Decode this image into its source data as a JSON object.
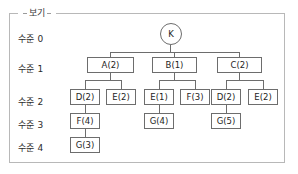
{
  "group": {
    "legend": "보기"
  },
  "levels": [
    {
      "label": "수준 0",
      "x": 18,
      "y": 32
    },
    {
      "label": "수준 1",
      "x": 18,
      "y": 62
    },
    {
      "label": "수준 2",
      "x": 18,
      "y": 95
    },
    {
      "label": "수준 3",
      "x": 18,
      "y": 118
    },
    {
      "label": "수준 4",
      "x": 18,
      "y": 141
    }
  ],
  "nodes": [
    {
      "id": "root",
      "label": "K",
      "shape": "circle",
      "x": 160,
      "y": 23,
      "w": 22,
      "h": 22
    },
    {
      "id": "a",
      "label": "A(2)",
      "shape": "rect",
      "x": 87,
      "y": 57,
      "w": 47,
      "h": 16
    },
    {
      "id": "b",
      "label": "B(1)",
      "shape": "rect",
      "x": 152,
      "y": 57,
      "w": 45,
      "h": 16
    },
    {
      "id": "c",
      "label": "C(2)",
      "shape": "rect",
      "x": 217,
      "y": 57,
      "w": 45,
      "h": 16
    },
    {
      "id": "a-d",
      "label": "D(2)",
      "shape": "rect",
      "x": 70,
      "y": 89,
      "w": 30,
      "h": 16
    },
    {
      "id": "a-e",
      "label": "E(2)",
      "shape": "rect",
      "x": 106,
      "y": 89,
      "w": 30,
      "h": 16
    },
    {
      "id": "b-e",
      "label": "E(1)",
      "shape": "rect",
      "x": 144,
      "y": 89,
      "w": 30,
      "h": 16
    },
    {
      "id": "b-f",
      "label": "F(3)",
      "shape": "rect",
      "x": 180,
      "y": 89,
      "w": 30,
      "h": 16
    },
    {
      "id": "c-d",
      "label": "D(2)",
      "shape": "rect",
      "x": 211,
      "y": 89,
      "w": 30,
      "h": 16
    },
    {
      "id": "c-e",
      "label": "E(2)",
      "shape": "rect",
      "x": 248,
      "y": 89,
      "w": 30,
      "h": 16
    },
    {
      "id": "a-d-f",
      "label": "F(4)",
      "shape": "rect",
      "x": 70,
      "y": 113,
      "w": 30,
      "h": 16
    },
    {
      "id": "b-e-g",
      "label": "G(4)",
      "shape": "rect",
      "x": 144,
      "y": 113,
      "w": 30,
      "h": 16
    },
    {
      "id": "c-d-g",
      "label": "G(5)",
      "shape": "rect",
      "x": 211,
      "y": 113,
      "w": 30,
      "h": 16
    },
    {
      "id": "a-d-f-g",
      "label": "G(3)",
      "shape": "rect",
      "x": 70,
      "y": 137,
      "w": 30,
      "h": 16
    }
  ],
  "connectors": [
    {
      "name": "root-stem",
      "dir": "v",
      "x": 170,
      "y": 45,
      "len": 8
    },
    {
      "name": "level1-bus",
      "dir": "h",
      "x": 110,
      "y": 52,
      "len": 130
    },
    {
      "name": "to-a",
      "dir": "v",
      "x": 110,
      "y": 52,
      "len": 5
    },
    {
      "name": "to-b",
      "dir": "v",
      "x": 174,
      "y": 52,
      "len": 5
    },
    {
      "name": "to-c",
      "dir": "v",
      "x": 239,
      "y": 52,
      "len": 5
    },
    {
      "name": "root-bus-stem",
      "dir": "v",
      "x": 170,
      "y": 52,
      "len": 1
    },
    {
      "name": "a-stem",
      "dir": "v",
      "x": 110,
      "y": 73,
      "w": 1,
      "len": 7
    },
    {
      "name": "a-bus",
      "dir": "h",
      "x": 85,
      "y": 80,
      "len": 36
    },
    {
      "name": "a-to-d",
      "dir": "v",
      "x": 85,
      "y": 80,
      "len": 9
    },
    {
      "name": "a-to-e",
      "dir": "v",
      "x": 121,
      "y": 80,
      "len": 9
    },
    {
      "name": "b-stem",
      "dir": "v",
      "x": 174,
      "y": 73,
      "len": 7
    },
    {
      "name": "b-bus",
      "dir": "h",
      "x": 159,
      "y": 80,
      "len": 36
    },
    {
      "name": "b-to-e",
      "dir": "v",
      "x": 159,
      "y": 80,
      "len": 9
    },
    {
      "name": "b-to-f",
      "dir": "v",
      "x": 195,
      "y": 80,
      "len": 9
    },
    {
      "name": "c-stem",
      "dir": "v",
      "x": 239,
      "y": 73,
      "len": 7
    },
    {
      "name": "c-bus",
      "dir": "h",
      "x": 226,
      "y": 80,
      "len": 37
    },
    {
      "name": "c-to-d",
      "dir": "v",
      "x": 226,
      "y": 80,
      "len": 9
    },
    {
      "name": "c-to-e",
      "dir": "v",
      "x": 263,
      "y": 80,
      "len": 9
    },
    {
      "name": "ad-to-af",
      "dir": "v",
      "x": 85,
      "y": 105,
      "len": 8
    },
    {
      "name": "be-to-bg",
      "dir": "v",
      "x": 159,
      "y": 105,
      "len": 8
    },
    {
      "name": "cd-to-cg",
      "dir": "v",
      "x": 226,
      "y": 105,
      "len": 8
    },
    {
      "name": "af-to-ag",
      "dir": "v",
      "x": 85,
      "y": 129,
      "len": 8
    }
  ]
}
